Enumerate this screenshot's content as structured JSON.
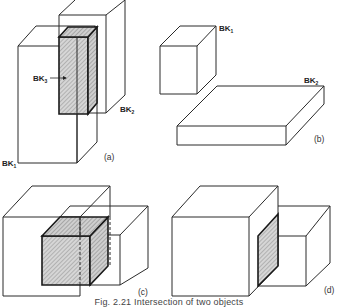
{
  "figure": {
    "caption": "Fig. 2.21 Intersection of two objects",
    "caption_clipped": true
  },
  "panels": [
    {
      "id": "a",
      "label": "(a)",
      "label_pos": [
        104,
        157
      ],
      "objects": [
        {
          "name": "BK1",
          "label": "BK",
          "sub": "1",
          "label_pos": [
            2,
            163
          ],
          "role": "block"
        },
        {
          "name": "BK2",
          "label": "BK",
          "sub": "2",
          "label_pos": [
            120,
            112
          ],
          "role": "block"
        },
        {
          "name": "BK3",
          "label": "BK",
          "sub": "3",
          "label_pos": [
            33,
            81
          ],
          "role": "intersection",
          "arrow": true
        }
      ]
    },
    {
      "id": "b",
      "label": "(b)",
      "label_pos": [
        314,
        140
      ],
      "objects": [
        {
          "name": "BK1",
          "label": "BK",
          "sub": "1",
          "label_pos": [
            219,
            31
          ],
          "role": "block"
        },
        {
          "name": "BK2",
          "label": "BK",
          "sub": "2",
          "label_pos": [
            304,
            83
          ],
          "role": "slab"
        }
      ]
    },
    {
      "id": "c",
      "label": "(c)",
      "label_pos": [
        138,
        295
      ],
      "objects": [
        {
          "name": "cube-large",
          "role": "block"
        },
        {
          "name": "cube-small",
          "role": "block"
        },
        {
          "name": "intersection",
          "role": "intersection"
        }
      ]
    },
    {
      "id": "d",
      "label": "(d)",
      "label_pos": [
        324,
        293
      ],
      "objects": [
        {
          "name": "cube-large",
          "role": "block"
        },
        {
          "name": "cube-small",
          "role": "block"
        },
        {
          "name": "contact-face",
          "role": "intersection"
        }
      ]
    }
  ],
  "colors": {
    "line": "#2a2a2a",
    "hatch_bg": "#d8d8d8",
    "hatch_line": "#8a8a8a",
    "background": "#ffffff"
  }
}
